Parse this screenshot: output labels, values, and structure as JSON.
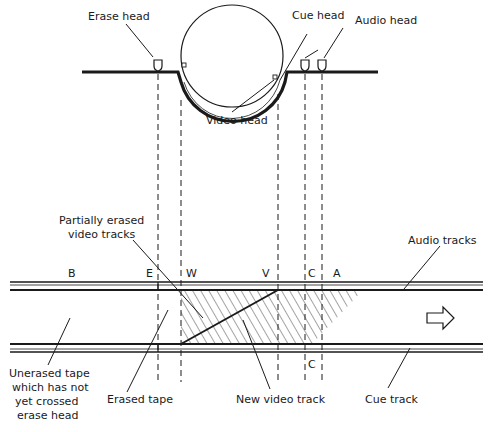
{
  "diagram": {
    "heads": {
      "erase_head": "Erase head",
      "cue_head": "Cue head",
      "audio_head": "Audio head",
      "video_head": "Video head"
    },
    "labels": {
      "partially_erased_line1": "Partially erased",
      "partially_erased_line2": "video tracks",
      "audio_tracks": "Audio tracks",
      "unerased_line1": "Unerased tape",
      "unerased_line2": "which has not",
      "unerased_line3": "yet crossed",
      "unerased_line4": "erase head",
      "erased_tape": "Erased tape",
      "new_video_track": "New video track",
      "cue_track": "Cue track"
    },
    "position_letters": {
      "B": "B",
      "E": "E",
      "W": "W",
      "V": "V",
      "C": "C",
      "A": "A",
      "C_bottom": "C"
    },
    "direction_arrow": "tape-motion-right",
    "colors": {
      "ink": "#1a1a1a",
      "background": "#ffffff"
    }
  }
}
